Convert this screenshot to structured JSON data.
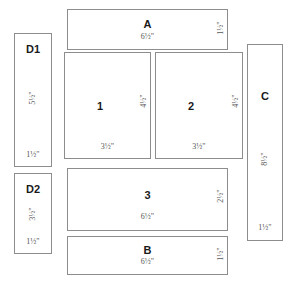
{
  "diagram": {
    "unit": "\"",
    "colors": {
      "border": "#8d8d8d",
      "background": "#ffffff",
      "label_text": "#1a1a1a",
      "dimension_text": "#555555"
    },
    "pieces": [
      {
        "id": "d1",
        "label": "D1",
        "width_label": "1",
        "width_frac": "1/2",
        "width_text": "1½\"",
        "height_label": "5",
        "height_frac": "1/2",
        "height_text": "5½\"",
        "orientation": "vertical"
      },
      {
        "id": "d2",
        "label": "D2",
        "width_label": "1",
        "width_frac": "1/2",
        "width_text": "1½\"",
        "height_label": "3",
        "height_frac": "1/2",
        "height_text": "3½\"",
        "orientation": "vertical"
      },
      {
        "id": "a",
        "label": "A",
        "width_label": "6",
        "width_frac": "1/2",
        "width_text": "6½\"",
        "height_label": "1",
        "height_frac": "1/2",
        "height_text": "1½\"",
        "orientation": "horizontal"
      },
      {
        "id": "1",
        "label": "1",
        "width_label": "3",
        "width_frac": "1/2",
        "width_text": "3½\"",
        "height_label": "4",
        "height_frac": "1/2",
        "height_text": "4½\"",
        "orientation": "block"
      },
      {
        "id": "2",
        "label": "2",
        "width_label": "3",
        "width_frac": "1/2",
        "width_text": "3½\"",
        "height_label": "4",
        "height_frac": "1/2",
        "height_text": "4½\"",
        "orientation": "block"
      },
      {
        "id": "3",
        "label": "3",
        "width_label": "6",
        "width_frac": "1/2",
        "width_text": "6½\"",
        "height_label": "2",
        "height_frac": "1/2",
        "height_text": "2½\"",
        "orientation": "horizontal"
      },
      {
        "id": "b",
        "label": "B",
        "width_label": "6",
        "width_frac": "1/2",
        "width_text": "6½\"",
        "height_label": "1",
        "height_frac": "1/2",
        "height_text": "1½\"",
        "orientation": "horizontal"
      },
      {
        "id": "c",
        "label": "C",
        "width_label": "1",
        "width_frac": "1/2",
        "width_text": "1½\"",
        "height_label": "8",
        "height_frac": "1/2",
        "height_text": "8½\"",
        "orientation": "vertical"
      }
    ]
  }
}
